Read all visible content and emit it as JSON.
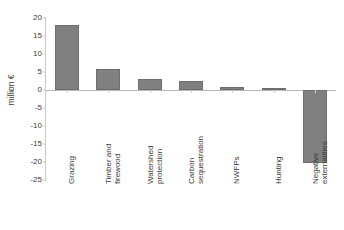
{
  "chart_data": {
    "type": "bar",
    "title": "",
    "xlabel": "",
    "ylabel": "million €",
    "ylim": [
      -25,
      20
    ],
    "ytick_step": 5,
    "grid": false,
    "legend": "none",
    "bar_color": "#808080",
    "categories": [
      "Grazing",
      "Timber and firewood",
      "Watershed protection",
      "Carbon sequestration",
      "NWFPs",
      "Hunting",
      "Negative externalities"
    ],
    "category_lines": [
      [
        "Grazing",
        ""
      ],
      [
        "Timber and",
        "firewood"
      ],
      [
        "Watershed",
        "protection"
      ],
      [
        "Carbon",
        "sequestration"
      ],
      [
        "NWFPs",
        ""
      ],
      [
        "Hunting",
        ""
      ],
      [
        "Negative",
        "externalities"
      ]
    ],
    "values": [
      18.0,
      5.8,
      3.1,
      2.6,
      0.7,
      0.6,
      -20.3
    ],
    "ytick_labels": [
      "20",
      "15",
      "10",
      "5",
      "0",
      "-5",
      "-10",
      "-15",
      "-20",
      "-25"
    ],
    "ytick_values": [
      20,
      15,
      10,
      5,
      0,
      -5,
      -10,
      -15,
      -20,
      -25
    ]
  }
}
